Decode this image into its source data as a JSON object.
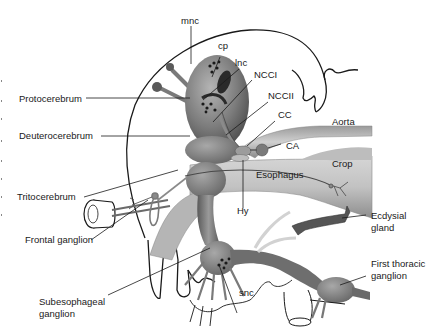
{
  "diagram": {
    "labels": {
      "mnc": "mnc",
      "cp": "cp",
      "lnc": "lnc",
      "ncc1": "NCCI",
      "ncc2": "NCCII",
      "cc": "CC",
      "aorta": "Aorta",
      "ca": "CA",
      "crop": "Crop",
      "esophagus": "Esophagus",
      "hy": "Hy",
      "protocerebrum": "Protocerebrum",
      "deuterocerebrum": "Deuterocerebrum",
      "tritocerebrum": "Tritocerebrum",
      "frontal_ganglion": "Frontal ganglion",
      "subesophageal_line1": "Subesophageal",
      "subesophageal_line2": "ganglion",
      "snc": "snc",
      "ecdysial_line1": "Ecdysial",
      "ecdysial_line2": "gland",
      "thoracic_line1": "First thoracic",
      "thoracic_line2": "ganglion"
    },
    "colors": {
      "outline": "#1a1a1a",
      "tissue_dark": "#6e6e6e",
      "tissue_mid": "#9a9a9a",
      "tissue_light": "#c9c9c9",
      "background": "#ffffff"
    }
  }
}
